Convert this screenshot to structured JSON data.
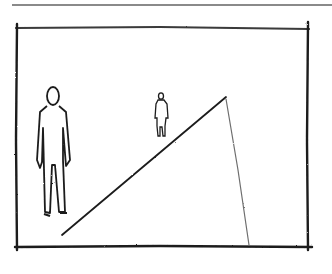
{
  "image": {
    "kind": "pencil-sketch",
    "description": "Perspective sketch: framed scene with horizon line, large foreground figure, small distant figure, and converging ground lines",
    "colors": {
      "ink": "#1c1c1c",
      "light_ink": "#6e6e6e",
      "paper": "#ffffff",
      "top_rule": "#8a8a8a"
    }
  },
  "frame": {
    "left": 17,
    "right": 308,
    "top": 27,
    "bottom": 246
  },
  "horizon": {
    "y": 96,
    "x_start": 20,
    "x_end": 302
  },
  "vanishing_point": {
    "x": 226,
    "y": 97
  },
  "figures": [
    {
      "name": "foreground-person",
      "x": 52,
      "top": 87,
      "bottom": 218
    },
    {
      "name": "background-person",
      "x": 161,
      "top": 92,
      "bottom": 137
    }
  ]
}
